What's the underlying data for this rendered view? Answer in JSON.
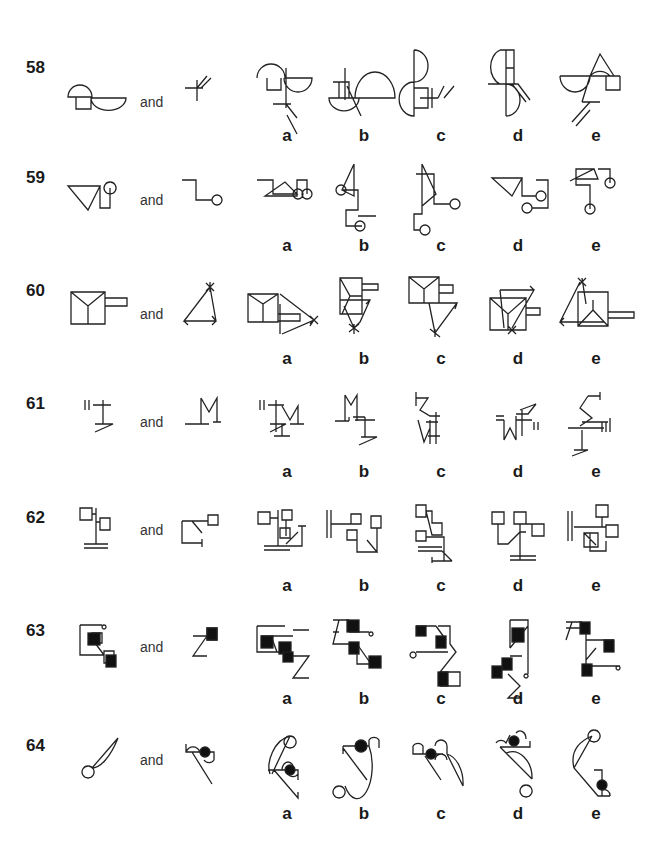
{
  "connector_word": "and",
  "questions": [
    {
      "number": "58",
      "options": [
        "a",
        "b",
        "c",
        "d",
        "e"
      ],
      "stem": [
        {
          "x": 68,
          "y": 80,
          "d": "M0 17 A12 12 0 0 1 24 17 Z M8 17 V29 H23 V17 M23 18 A17 12 0 0 0 58 18 Z"
        },
        {
          "x": 185,
          "y": 70,
          "d": "M0 18 H18 M12 10 V31 M12 18 L22 6 M16 18 L26 8"
        }
      ],
      "answers": [
        {
          "x": 257,
          "y": 58,
          "d": "M0 20 A14 14 0 0 1 28 20 H55 A14 14 0 0 1 27 20 M10 20 V32 H24 V20 M29 10 V50 M16 46 H34 M29 46 L40 60 M30 57 L40 76"
        },
        {
          "x": 325,
          "y": 68,
          "d": "M20 0 V32 M8 14 H24 V30 M14 14 V30 M4 30 A14 12 0 0 0 34 30 Z M22 18 L36 48 M30 30 A20 26 0 0 1 70 30 H20"
        },
        {
          "x": 408,
          "y": 50,
          "d": "M6 0 A14 16 0 0 1 6 32 V0 M6 32 A14 16 0 0 0 6 66 V32 M6 38 H20 V58 H6 M12 48 H30 M24 38 V58 M30 48 L36 36 M36 48 L46 36"
        },
        {
          "x": 488,
          "y": 50,
          "d": "M18 0 V66 M12 0 H26 V34 H18 M18 18 H26 M12 0 A14 18 0 0 0 12 34 M0 34 H30 L42 50 M24 34 L38 52 M18 34 A14 16 0 0 1 18 66"
        },
        {
          "x": 560,
          "y": 52,
          "d": "M0 24 H60 M0 24 A15 16 0 0 0 30 24 A15 18 0 0 1 50 24 M30 24 L40 2 L54 24 M46 24 V38 H60 V24 M30 24 L22 50 M22 50 H40 M30 50 L12 70 M30 58 L16 74"
        }
      ]
    },
    {
      "number": "59",
      "options": [
        "a",
        "b",
        "c",
        "d",
        "e"
      ],
      "stem": [
        {
          "x": 68,
          "y": 178,
          "d": "M0 8 H32 L20 32 Z M32 8 V30 H42 V10 M42 10 m0 -6 a6 6 0 1 0 0.1 0"
        },
        {
          "x": 182,
          "y": 178,
          "d": "M0 2 H14 V22 H30 M30 22 m0 0 a5 5 0 1 0 10 0 a5 5 0 1 0 -10 0"
        }
      ],
      "answers": [
        {
          "x": 257,
          "y": 178,
          "d": "M0 2 H16 V16 H40 L28 4 L8 18 H40 V2 H50 V16 M36 16 m0 0 a5 5 0 1 0 10 0 a5 5 0 1 0 -10 0 M50 16 m-5 0 a5 5 0 1 0 10 0 a5 5 0 1 0 -10 0"
        },
        {
          "x": 336,
          "y": 164,
          "d": "M18 0 L6 26 L18 32 V0 M6 26 H22 V46 H10 V62 H26 M0 26 m0 0 a5 5 0 1 0 10 0 a5 5 0 1 0 -10 0 M24 62 m-5 0 a5 5 0 1 0 10 0 a5 5 0 1 0 -10 0 M22 52 H40"
        },
        {
          "x": 414,
          "y": 164,
          "d": "M8 0 L22 30 L8 42 V0 M2 10 H20 V40 H36 M36 40 m0 0 a5 5 0 1 0 10 0 a5 5 0 1 0 -10 0 M8 42 V50 H0 V66 H6 M6 66 m0 0 a5 5 0 1 0 10 0 a5 5 0 1 0 -10 0"
        },
        {
          "x": 492,
          "y": 178,
          "d": "M0 0 H30 L20 18 Z M30 0 V18 H44 M44 18 m0 0 a5 5 0 1 0 10 0 a5 5 0 1 0 -10 0 M44 2 H56 V30 H40 M30 30 m0 0 a5 5 0 1 0 10 0 a5 5 0 1 0 -10 0"
        },
        {
          "x": 570,
          "y": 165,
          "d": "M0 16 L24 4 L28 14 H6 V4 H24 M6 14 V20 H20 V44 M20 44 m-5 0 a5 5 0 1 0 10 0 a5 5 0 1 0 -10 0 M28 4 H40 V18 M40 18 m-5 0 a5 5 0 1 0 10 0 a5 5 0 1 0 -10 0"
        }
      ]
    },
    {
      "number": "60",
      "options": [
        "a",
        "b",
        "c",
        "d",
        "e"
      ],
      "stem": [
        {
          "x": 71,
          "y": 292,
          "d": "M0 0 H34 V32 H0 Z M0 0 L17 14 L34 0 M17 14 V32 M34 6 H56 V14 H34"
        },
        {
          "x": 184,
          "y": 287,
          "d": "M26 0 L0 34 H32 Z M22 -4 L30 4 M30 -4 L22 4 M26 -5 V5 M0 34 l4 -5 M0 34 l4 4 M32 34 l-4 -5 M32 34 l-4 4"
        }
      ],
      "answers": [
        {
          "x": 248,
          "y": 290,
          "d": "M0 4 H30 V32 H0 Z M0 4 L15 14 L30 4 M15 14 V32 M30 24 H52 V31 H30 M32 4 L66 30 L34 44 M66 30 l-5 -4 M66 30 l-4 6 M62 26 L70 34 M70 26 L62 34 M32 14 V44"
        },
        {
          "x": 340,
          "y": 278,
          "d": "M0 0 H22 V36 H0 Z M0 0 L10 18 H22 M10 18 L2 36 M22 6 H38 V12 H22 M0 22 H30 L20 44 L14 50 L4 28 M30 22 L26 26 M14 50 m-5 -4 l10 8 M14 50 m5 -4 l-10 8 M14 46 V56"
        },
        {
          "x": 409,
          "y": 277,
          "d": "M0 0 H30 V26 H0 Z M0 0 L15 12 L30 0 M15 12 V26 M30 8 H44 V16 H30 M30 26 H48 L26 56 L20 26 M48 26 l-2 6 M26 56 l-5 -4 m10 8 l-10 -8 M26 52 V60"
        },
        {
          "x": 490,
          "y": 288,
          "d": "M0 10 H36 V42 H0 Z M0 10 L18 26 L36 10 M18 26 V42 M36 20 H50 V27 H36 M10 2 H44 L22 40 M44 2 l-4 -4 M10 2 l4 38 M18 38 l8 8 M26 38 l-8 8"
        },
        {
          "x": 560,
          "y": 282,
          "d": "M20 0 L0 40 H44 M18 -4 L26 4 M26 -4 L18 4 M22 -4 L26 22 M0 40 l4 -4 M0 40 l4 4 M18 10 H48 V44 H18 Z M18 44 L33 28 L48 44 M33 28 V18 M48 30 H74 V36 H48"
        }
      ]
    },
    {
      "number": "61",
      "options": [
        "a",
        "b",
        "c",
        "d",
        "e"
      ],
      "stem": [
        {
          "x": 85,
          "y": 400,
          "d": "M0 0 V10 M4 0 V10 M8 5 H26 M18 0 V24 M10 24 H28 L10 32"
        },
        {
          "x": 185,
          "y": 398,
          "d": "M16 0 V26 M16 0 L24 14 L32 0 V24 M28 24 H36 M0 26 H24"
        }
      ],
      "answers": [
        {
          "x": 260,
          "y": 400,
          "d": "M0 0 V10 M4 0 V10 M8 5 H24 M16 0 V32 M10 24 H26 L10 32 M14 36 H30 M22 24 V36 M22 6 L30 20 L38 6 V24 M30 24 H44"
        },
        {
          "x": 335,
          "y": 395,
          "d": "M10 0 V26 M10 0 L16 10 L22 0 V22 M0 26 H14 M14 22 V26 M18 22 H30 M22 18 V26 M20 25 H40 M30 22 V42 M26 42 H42 L24 50"
        },
        {
          "x": 416,
          "y": 392,
          "d": "M0 0 V14 M0 6 H12 L4 18 L14 24 H24 M20 20 V52 M14 28 V52 M14 36 L8 50 L2 28 M12 44 H24 M10 30 H22"
        },
        {
          "x": 496,
          "y": 400,
          "d": "M8 20 V40 L14 28 L20 40 V16 M0 16 H8 M0 20 H8 M20 20 H36 M26 10 V36 M20 14 H32 L40 4 M38 22 V30 M42 22 V30 M24 10 L40 4"
        },
        {
          "x": 568,
          "y": 392,
          "d": "M20 4 H32 V0 V8 M20 4 L12 16 L24 26 L12 34 M0 36 H36 M14 30 H40 M14 38 V58 M34 30 V40 M38 30 V40 M42 26 V40 M6 58 H20 L4 64"
        }
      ]
    },
    {
      "number": "62",
      "options": [
        "a",
        "b",
        "c",
        "d",
        "e"
      ],
      "stem": [
        {
          "x": 80,
          "y": 508,
          "d": "M0 0 H12 V12 H0 Z M12 6 H16 M16 0 V36 M16 14 H20 M20 10 H30 V22 H20 Z M4 36 H28 M4 40 H28"
        },
        {
          "x": 182,
          "y": 515,
          "d": "M0 6 H10 L20 18 M0 6 V28 H20 M20 24 V32 M10 6 H26 M26 0 H36 V10 H26 Z"
        }
      ],
      "answers": [
        {
          "x": 258,
          "y": 510,
          "d": "M0 2 H12 V14 H0 Z M12 8 H20 M20 0 V36 M6 36 H32 M6 40 H32 M24 0 H34 V10 H24 Z M28 10 V26 M22 18 H32 V28 H22 Z M28 34 L40 22 M28 36 H44 V16 M40 16 H48"
        },
        {
          "x": 327,
          "y": 510,
          "d": "M0 0 V28 M4 0 V28 M4 14 H34 M24 4 H34 V14 H24 Z M20 20 H30 V30 H20 Z M30 20 V42 H50 L40 30 M44 6 H54 V18 H44 Z M50 18 V42"
        },
        {
          "x": 416,
          "y": 505,
          "d": "M0 0 H10 V12 H0 Z M10 6 H16 V18 H26 V30 H16 Z M0 26 H10 V36 H0 Z M10 32 H28 V56 M2 42 H26 M2 46 H26 M26 46 L36 56 M16 56 H36 M16 52 V58"
        },
        {
          "x": 492,
          "y": 510,
          "d": "M0 2 H12 V14 H0 Z M6 14 V34 H16 L28 22 H34 M22 2 H34 V14 H22 Z M28 14 V50 M28 14 H40 M40 14 H52 V26 H40 Z M18 46 H44 M18 50 H44"
        },
        {
          "x": 568,
          "y": 505,
          "d": "M0 6 V36 M4 6 V36 M6 22 H38 M28 0 H40 V12 H28 Z M34 12 V22 M38 20 H50 V32 H38 Z M16 28 H30 V42 H16 Z M16 28 L28 40 M22 28 V46 H38 V36 M38 40 V46"
        }
      ]
    },
    {
      "number": "63",
      "options": [
        "a",
        "b",
        "c",
        "d",
        "e"
      ],
      "stem": [
        {
          "x": 80,
          "y": 625,
          "d": "M0 0 H22 M0 0 V30 H24 M22 0 m2 0 a2 2 0 1 0 0.1 0 M12 14 L24 30 M12 8 h10 v10 h-10 z M24 26 h10 v12 h-10 z",
          "fills": [
            [
              8,
              8,
              12,
              12
            ],
            [
              26,
              30,
              10,
              12
            ]
          ]
        },
        {
          "x": 193,
          "y": 628,
          "d": "M0 8 H14 L0 28 H14 M14 0 V8 M14 0 H24 V12 H14 Z",
          "fills": [
            [
              14,
              0,
              10,
              12
            ]
          ]
        }
      ],
      "answers": [
        {
          "x": 257,
          "y": 626,
          "d": "M0 0 H28 M0 0 V26 H22 M4 10 H36 M20 26 L14 10 M36 4 H52 M36 30 H52 L36 52 H52",
          "fills": [
            [
              4,
              10,
              12,
              12
            ],
            [
              22,
              16,
              12,
              12
            ],
            [
              26,
              26,
              10,
              10
            ]
          ]
        },
        {
          "x": 333,
          "y": 620,
          "d": "M0 0 H16 M0 12 H6 M6 0 L0 24 H24 V44 H40 M16 12 H36 M36 12 m2 0 a2 2 0 1 0 0.1 0 M24 24 L38 44",
          "fills": [
            [
              14,
              0,
              12,
              12
            ],
            [
              16,
              22,
              10,
              12
            ],
            [
              36,
              36,
              12,
              12
            ]
          ]
        },
        {
          "x": 416,
          "y": 626,
          "d": "M0 0 H20 M20 0 L30 14 M22 0 H34 V18 L40 26 L24 46 H44 V60 H24 M0 26 H32 M0 26 m-3 0 a3 3 0 1 0 0.1 0",
          "fills": [
            [
              0,
              0,
              10,
              10
            ],
            [
              20,
              10,
              10,
              12
            ],
            [
              22,
              46,
              10,
              14
            ]
          ]
        },
        {
          "x": 492,
          "y": 620,
          "d": "M18 0 H36 V54 M18 0 V28 M18 28 L36 6 M36 54 m-2 0 a2 2 0 1 0 0.1 0 M18 36 H30 M16 54 L28 66 L16 78 H30",
          "fills": [
            [
              20,
              8,
              12,
              14
            ],
            [
              10,
              38,
              10,
              12
            ],
            [
              0,
              46,
              10,
              12
            ]
          ]
        },
        {
          "x": 566,
          "y": 622,
          "d": "M0 0 H16 M6 0 L0 18 M0 6 H20 M20 6 V38 L30 26 M20 38 V44 M20 44 H54 M20 18 H48 M54 44 m-2 0 a2 2 0 1 0 0.1 0",
          "fills": [
            [
              14,
              0,
              10,
              12
            ],
            [
              38,
              18,
              10,
              12
            ],
            [
              16,
              42,
              10,
              12
            ]
          ]
        }
      ]
    },
    {
      "number": "64",
      "options": [
        "a",
        "b",
        "c",
        "d",
        "e"
      ],
      "stem": [
        {
          "x": 80,
          "y": 738,
          "d": "M38 0 L12 30 M38 0 C30 20 20 30 12 30 M12 30 m-4 -2 a6 6 0 1 0 0.1 0"
        },
        {
          "x": 186,
          "y": 738,
          "d": "M0 14 A8 10 0 0 1 14 14 M0 6 V14 H28 V22 M6 14 L26 46 M28 22 A6 6 0 0 1 18 22",
          "fills_circles": [
            [
              19,
              14,
              5
            ]
          ]
        }
      ],
      "answers": [
        {
          "x": 262,
          "y": 730,
          "d": "M28 6 L10 44 M28 6 C12 10 4 32 8 44 M34 6 m-6 0 a6 6 0 1 0 0.1 0 M6 40 H36 V50 M12 40 L36 68 V62 M20 40 A6 8 0 0 1 32 40 M36 44 A6 6 0 0 1 26 44",
          "fills_circles": [
            [
              28,
              40,
              5
            ]
          ]
        },
        {
          "x": 343,
          "y": 740,
          "d": "M0 6 H26 M0 6 V14 M26 6 V0 M26 6 A14 30 0 0 1 2 46 M0 8 L24 40 M26 0 A6 6 0 0 1 36 0 V8 M2 46 m-6 0 a6 6 0 1 0 0.1 0",
          "fills_circles": [
            [
              18,
              6,
              6
            ]
          ]
        },
        {
          "x": 413,
          "y": 740,
          "d": "M0 6 V14 H30 M0 6 A6 6 0 0 1 10 6 V14 M12 16 L28 40 M22 6 A6 6 0 0 1 34 6 V14 M34 14 A20 30 0 0 1 50 46 M34 14 L50 46 M22 20 A6 6 0 0 1 34 20",
          "fills_circles": [
            [
              18,
              14,
              5
            ]
          ]
        },
        {
          "x": 496,
          "y": 733,
          "d": "M0 10 A6 6 0 0 1 10 10 L14 2 M4 14 H34 V8 M20 0 A6 8 0 0 1 30 6 M4 14 L36 46 M10 20 A20 26 0 0 1 36 46 M36 52 m-6 0 a6 6 0 1 0 0.1 0",
          "fills_circles": [
            [
              18,
              8,
              5
            ]
          ]
        },
        {
          "x": 570,
          "y": 730,
          "d": "M24 0 A6 6 0 1 0 24.1 0 M22 6 C8 12 0 22 4 38 L28 66 H40 M4 38 L22 6 M24 40 H32 V50 M32 60 A6 6 0 0 1 40 66 M32 56 V66",
          "fills_circles": [
            [
              32,
              55,
              5
            ]
          ]
        }
      ]
    }
  ],
  "row_layout": {
    "rows_y": [
      58,
      168,
      281,
      394,
      508,
      621,
      736
    ],
    "label_offset": 80,
    "and_x": 140,
    "option_x": [
      287,
      364,
      441,
      518,
      596
    ]
  }
}
